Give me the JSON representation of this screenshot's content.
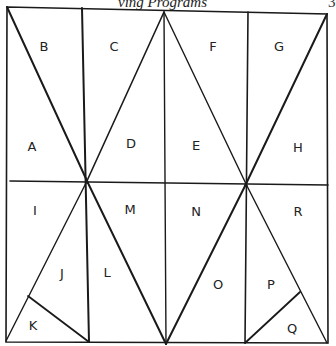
{
  "caption": "ving Programs",
  "caption_right": "3",
  "regions": [
    {
      "label": "B",
      "x": 44,
      "y": 46
    },
    {
      "label": "C",
      "x": 114,
      "y": 46
    },
    {
      "label": "F",
      "x": 213,
      "y": 46
    },
    {
      "label": "G",
      "x": 279,
      "y": 46
    },
    {
      "label": "A",
      "x": 32,
      "y": 146
    },
    {
      "label": "D",
      "x": 131,
      "y": 143
    },
    {
      "label": "E",
      "x": 196,
      "y": 145
    },
    {
      "label": "H",
      "x": 298,
      "y": 147
    },
    {
      "label": "I",
      "x": 35,
      "y": 210
    },
    {
      "label": "M",
      "x": 130,
      "y": 209
    },
    {
      "label": "N",
      "x": 196,
      "y": 211
    },
    {
      "label": "R",
      "x": 298,
      "y": 211
    },
    {
      "label": "J",
      "x": 62,
      "y": 273
    },
    {
      "label": "L",
      "x": 107,
      "y": 272
    },
    {
      "label": "O",
      "x": 218,
      "y": 284
    },
    {
      "label": "P",
      "x": 271,
      "y": 284
    },
    {
      "label": "K",
      "x": 33,
      "y": 325
    },
    {
      "label": "Q",
      "x": 292,
      "y": 328
    }
  ]
}
